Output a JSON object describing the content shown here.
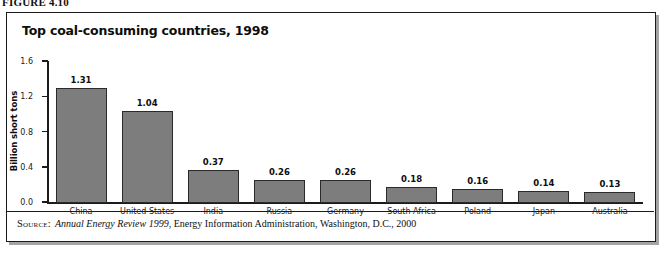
{
  "figure": {
    "label": "FIGURE 4.10"
  },
  "chart_data": {
    "type": "bar",
    "title": "Top coal-consuming countries, 1998",
    "xlabel": "",
    "ylabel": "Billion short tons",
    "ylim": [
      0.0,
      1.6
    ],
    "grid": false,
    "legend": null,
    "categories": [
      "China",
      "United States",
      "India",
      "Russia",
      "Germany",
      "South Africa",
      "Poland",
      "Japan",
      "Australia"
    ],
    "values": [
      1.31,
      1.04,
      0.37,
      0.26,
      0.26,
      0.18,
      0.16,
      0.14,
      0.13
    ],
    "value_labels": [
      "1.31",
      "1.04",
      "0.37",
      "0.26",
      "0.26",
      "0.18",
      "0.16",
      "0.14",
      "0.13"
    ],
    "y_ticks": [
      0.0,
      0.4,
      0.8,
      1.2,
      1.6
    ],
    "y_tick_labels": [
      "0.0",
      "0.4",
      "0.8",
      "1.2",
      "1.6"
    ],
    "bar_color": "#7d7d7d",
    "bar_edge_color": "#2a2a2a"
  },
  "source": {
    "kicker": "Source:",
    "publication": "Annual Energy Review 1999",
    "rest": ", Energy Information Administration, Washington, D.C., 2000"
  }
}
